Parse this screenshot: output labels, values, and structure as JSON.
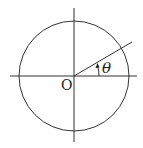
{
  "diagram": {
    "type": "unit-circle-angle",
    "origin_label": "O",
    "angle_label": "θ",
    "stroke_color": "#333333",
    "center": [
      74,
      76
    ],
    "radius": 55,
    "ray_angle_deg": 30
  }
}
